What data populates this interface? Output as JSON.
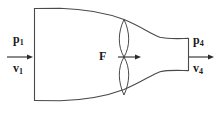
{
  "diagram": {
    "stroke_color": "#4a4a4a",
    "text_color": "#1a1a1a",
    "background_color": "#ffffff",
    "labels": {
      "inlet_pressure": {
        "symbol": "p",
        "subscript": "1"
      },
      "inlet_velocity": {
        "symbol": "v",
        "subscript": "1"
      },
      "outlet_pressure": {
        "symbol": "p",
        "subscript": "4"
      },
      "outlet_velocity": {
        "symbol": "v",
        "subscript": "4"
      },
      "throat_force": {
        "symbol": "F",
        "subscript": ""
      }
    },
    "arrows": [
      {
        "name": "inlet-flow-arrow",
        "direction": "right",
        "x1": 7,
        "y1": 57,
        "x2": 33,
        "y2": 57
      },
      {
        "name": "throat-force-arrow",
        "direction": "right",
        "x1": 118,
        "y1": 57,
        "x2": 141,
        "y2": 57
      },
      {
        "name": "outlet-flow-arrow",
        "direction": "right",
        "x1": 189,
        "y1": 57,
        "x2": 214,
        "y2": 57
      }
    ],
    "duct": {
      "inlet_left_x": 34,
      "inlet_top_y": 8,
      "inlet_bottom_y": 100,
      "outlet_right_x": 188,
      "outlet_top_y": 38,
      "outlet_bottom_y": 78,
      "throat_x": 124
    },
    "restriction": {
      "name": "butterfly-valve-lens",
      "center_x": 124,
      "center_y": 57,
      "top_y": 19,
      "bottom_y": 95,
      "half_width": 6
    }
  }
}
